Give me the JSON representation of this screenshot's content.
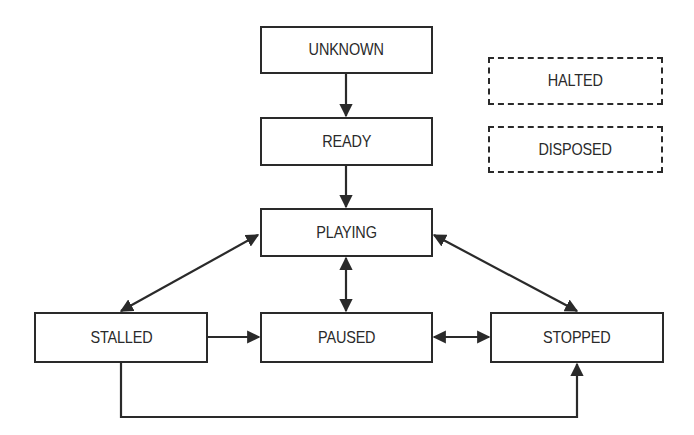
{
  "diagram": {
    "type": "state-diagram",
    "states": [
      {
        "id": "unknown",
        "label": "UNKNOWN",
        "style": "solid"
      },
      {
        "id": "ready",
        "label": "READY",
        "style": "solid"
      },
      {
        "id": "playing",
        "label": "PLAYING",
        "style": "solid"
      },
      {
        "id": "stalled",
        "label": "STALLED",
        "style": "solid"
      },
      {
        "id": "paused",
        "label": "PAUSED",
        "style": "solid"
      },
      {
        "id": "stopped",
        "label": "STOPPED",
        "style": "solid"
      },
      {
        "id": "halted",
        "label": "HALTED",
        "style": "dashed"
      },
      {
        "id": "disposed",
        "label": "DISPOSED",
        "style": "dashed"
      }
    ],
    "transitions": [
      {
        "from": "UNKNOWN",
        "to": "READY",
        "direction": "one-way"
      },
      {
        "from": "READY",
        "to": "PLAYING",
        "direction": "one-way"
      },
      {
        "from": "PLAYING",
        "to": "STALLED",
        "direction": "two-way"
      },
      {
        "from": "PLAYING",
        "to": "PAUSED",
        "direction": "two-way"
      },
      {
        "from": "PLAYING",
        "to": "STOPPED",
        "direction": "two-way"
      },
      {
        "from": "STALLED",
        "to": "PAUSED",
        "direction": "one-way"
      },
      {
        "from": "PAUSED",
        "to": "STOPPED",
        "direction": "two-way"
      },
      {
        "from": "STALLED",
        "to": "STOPPED",
        "direction": "one-way",
        "routing": "elbow-below"
      }
    ],
    "colors": {
      "stroke": "#2a2a2a",
      "background": "#ffffff"
    }
  }
}
